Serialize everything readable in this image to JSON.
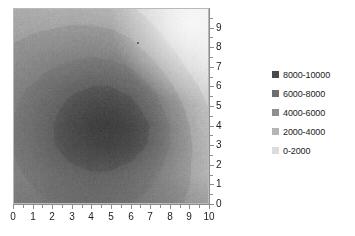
{
  "chart_data": {
    "type": "heatmap",
    "title": "",
    "xlabel": "",
    "ylabel": "",
    "xlim": [
      0,
      10
    ],
    "ylim": [
      0,
      10
    ],
    "xticks": [
      "0",
      "1",
      "2",
      "3",
      "4",
      "5",
      "6",
      "7",
      "8",
      "9",
      "10"
    ],
    "yticks": [
      "0",
      "1",
      "2",
      "3",
      "4",
      "5",
      "6",
      "7",
      "8",
      "9"
    ],
    "grid": false,
    "legend_position": "right",
    "value_range": [
      0,
      10000
    ],
    "band_size": 2000,
    "peak": {
      "x": 6.0,
      "y": 3.5,
      "value": 10000
    },
    "minimum_corner": {
      "x": 9.5,
      "y": 9.5,
      "value": 0
    },
    "legend": [
      {
        "label": "8000-10000",
        "color": "#4a4a4a",
        "min": 8000,
        "max": 10000
      },
      {
        "label": "6000-8000",
        "color": "#6e6e6e",
        "min": 6000,
        "max": 8000
      },
      {
        "label": "4000-6000",
        "color": "#8f8f8f",
        "min": 4000,
        "max": 6000
      },
      {
        "label": "2000-4000",
        "color": "#b5b5b5",
        "min": 2000,
        "max": 4000
      },
      {
        "label": "0-2000",
        "color": "#dcdcdc",
        "min": 0,
        "max": 2000
      }
    ],
    "series": [
      {
        "name": "surface",
        "x": [
          0,
          1,
          2,
          3,
          4,
          5,
          6,
          7,
          8,
          9,
          10
        ],
        "y": [
          0,
          1,
          2,
          3,
          4,
          5,
          6,
          7,
          8,
          9,
          10
        ],
        "z": [
          [
            5200,
            5600,
            6000,
            6300,
            6500,
            6400,
            6100,
            5500,
            4700,
            3800,
            3000
          ],
          [
            5600,
            6100,
            6700,
            7100,
            7400,
            7300,
            6900,
            6200,
            5200,
            4100,
            3100
          ],
          [
            5900,
            6600,
            7400,
            8000,
            8400,
            8400,
            7900,
            6900,
            5600,
            4200,
            3000
          ],
          [
            6100,
            6900,
            7900,
            8800,
            9400,
            9600,
            9100,
            7800,
            6100,
            4300,
            2800
          ],
          [
            6100,
            7000,
            8000,
            9000,
            9800,
            10000,
            9400,
            8000,
            6100,
            4100,
            2500
          ],
          [
            5900,
            6700,
            7600,
            8500,
            9100,
            9200,
            8600,
            7200,
            5400,
            3500,
            2000
          ],
          [
            5500,
            6200,
            6900,
            7600,
            8000,
            8000,
            7400,
            6100,
            4400,
            2700,
            1400
          ],
          [
            4900,
            5400,
            6000,
            6400,
            6700,
            6600,
            6000,
            4800,
            3300,
            1800,
            800
          ],
          [
            4200,
            4600,
            5000,
            5300,
            5400,
            5200,
            4600,
            3500,
            2200,
            1000,
            300
          ],
          [
            3500,
            3800,
            4000,
            4200,
            4200,
            4000,
            3400,
            2400,
            1300,
            400,
            100
          ],
          [
            2900,
            3100,
            3200,
            3300,
            3200,
            2900,
            2300,
            1400,
            600,
            100,
            0
          ]
        ]
      }
    ]
  },
  "axes": {
    "x": {
      "ticks": [
        "0",
        "1",
        "2",
        "3",
        "4",
        "5",
        "6",
        "7",
        "8",
        "9",
        "10"
      ]
    },
    "y": {
      "ticks": [
        "0",
        "1",
        "2",
        "3",
        "4",
        "5",
        "6",
        "7",
        "8",
        "9"
      ]
    }
  },
  "legend": {
    "items": [
      {
        "label": "8000-10000",
        "color": "#4a4a4a"
      },
      {
        "label": "6000-8000",
        "color": "#6e6e6e"
      },
      {
        "label": "4000-6000",
        "color": "#8f8f8f"
      },
      {
        "label": "2000-4000",
        "color": "#b5b5b5"
      },
      {
        "label": "0-2000",
        "color": "#dcdcdc"
      }
    ]
  },
  "artifacts": {
    "bleed_text": ""
  }
}
